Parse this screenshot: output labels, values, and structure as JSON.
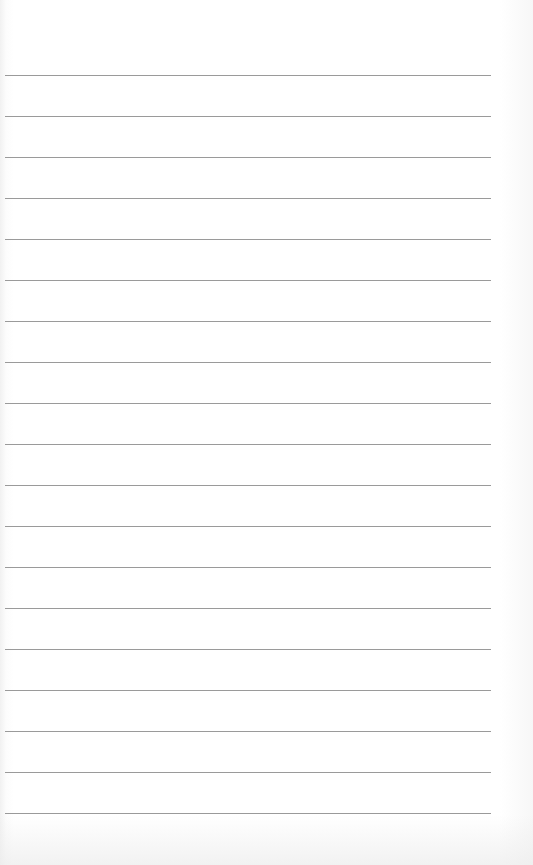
{
  "page": {
    "type": "lined-paper",
    "line_count": 19,
    "first_line_y": 75,
    "line_spacing": 41,
    "line_color": "#9a9a9a",
    "background_color": "#ffffff"
  }
}
